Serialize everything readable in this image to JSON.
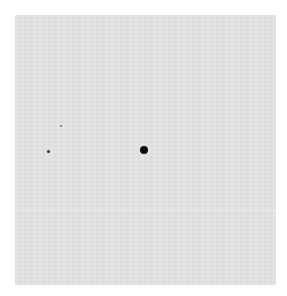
{
  "image": {
    "description": "Gray textured sheet with one large black dot near center and two tiny specks to the left",
    "background_color": "#ffffff",
    "sheet_color": "#e3e3e3",
    "dots": [
      {
        "label": "large-dot",
        "x": 144,
        "y": 150,
        "diameter": 8,
        "color": "#0a0a0a"
      },
      {
        "label": "small-speck",
        "x": 48,
        "y": 151,
        "diameter": 3,
        "color": "#333333"
      },
      {
        "label": "tiny-speck",
        "x": 61,
        "y": 126,
        "diameter": 2,
        "color": "#777777"
      }
    ]
  }
}
